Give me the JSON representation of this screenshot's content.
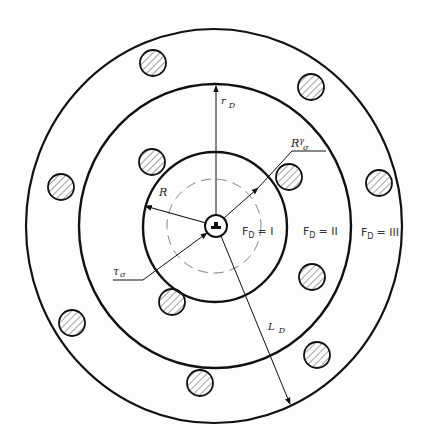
{
  "diagram": {
    "type": "concentric-zone-schematic",
    "stroke_color": "#111111",
    "hatch_color": "#555555",
    "circles": {
      "outer": {
        "cx": 214,
        "cy": 226,
        "rx": 188,
        "ry": 197
      },
      "middle": {
        "cx": 215,
        "cy": 226,
        "rx": 136,
        "ry": 142
      },
      "inner": {
        "cx": 215,
        "cy": 227,
        "rx": 72,
        "ry": 75
      },
      "dashed": {
        "cx": 214,
        "cy": 226,
        "r": 47
      },
      "hub": {
        "cx": 216,
        "cy": 226,
        "r": 11
      }
    },
    "labels": {
      "r_d": "r",
      "r_d_sub": "D",
      "R": "R",
      "R_gamma_sigma": "R",
      "R_gamma_sigma_sup": "γ",
      "R_gamma_sigma_sub": "σ",
      "r_sigma": "τ",
      "r_sigma_sub": "σ",
      "L_d": "L",
      "L_d_sub": "D"
    },
    "zones": [
      {
        "label": "F",
        "sub": "D",
        "value": "= I"
      },
      {
        "label": "F",
        "sub": "D",
        "value": "= II"
      },
      {
        "label": "F",
        "sub": "D",
        "value": "= III"
      }
    ],
    "hatched_disks": [
      {
        "cx": 153,
        "cy": 63,
        "r": 13
      },
      {
        "cx": 311,
        "cy": 87,
        "r": 13
      },
      {
        "cx": 152,
        "cy": 162,
        "r": 13
      },
      {
        "cx": 289,
        "cy": 177,
        "r": 13
      },
      {
        "cx": 61,
        "cy": 187,
        "r": 13
      },
      {
        "cx": 379,
        "cy": 183,
        "r": 13
      },
      {
        "cx": 312,
        "cy": 277,
        "r": 13
      },
      {
        "cx": 172,
        "cy": 302,
        "r": 13
      },
      {
        "cx": 72,
        "cy": 323,
        "r": 13
      },
      {
        "cx": 317,
        "cy": 355,
        "r": 13
      },
      {
        "cx": 200,
        "cy": 383,
        "r": 13
      }
    ]
  }
}
